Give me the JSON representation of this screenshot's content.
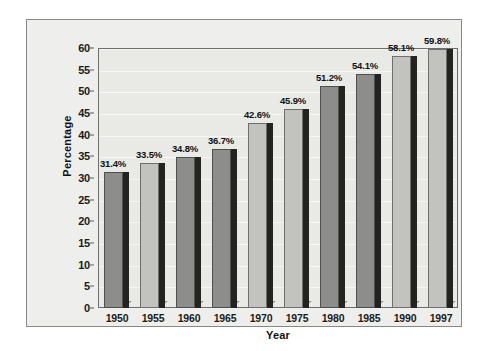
{
  "chart_data": {
    "type": "bar",
    "title": "",
    "xlabel": "Year",
    "ylabel": "Percentage",
    "categories": [
      "1950",
      "1955",
      "1960",
      "1965",
      "1970",
      "1975",
      "1980",
      "1985",
      "1990",
      "1997"
    ],
    "values": [
      31.4,
      33.5,
      34.8,
      36.7,
      42.6,
      45.9,
      51.2,
      54.1,
      58.1,
      59.8
    ],
    "data_labels": [
      "31.4%",
      "33.5%",
      "34.8%",
      "36.7%",
      "42.6%",
      "45.9%",
      "51.2%",
      "54.1%",
      "58.1%",
      "59.8%"
    ],
    "bar_styles": [
      "dark",
      "light",
      "dark",
      "dark",
      "light",
      "light",
      "dark",
      "dark",
      "light",
      "light"
    ],
    "ylim": [
      0,
      60
    ],
    "ytick_labels": [
      "60",
      "55",
      "50",
      "45",
      "40",
      "35",
      "30",
      "25",
      "20",
      "15",
      "10",
      "5",
      "0"
    ],
    "ytick_values": [
      60,
      55,
      50,
      45,
      40,
      35,
      30,
      25,
      20,
      15,
      10,
      5,
      0
    ],
    "grid": true,
    "legend": "none",
    "colors": {
      "bar_dark": "#8d8d8b",
      "bar_light": "#c2c2bf",
      "bar_shadow": "#23231f",
      "plot_background": "#e9e9e6",
      "frame_background": "#eeeeec",
      "gridline": "#f7f7f5",
      "text": "#111111"
    }
  }
}
